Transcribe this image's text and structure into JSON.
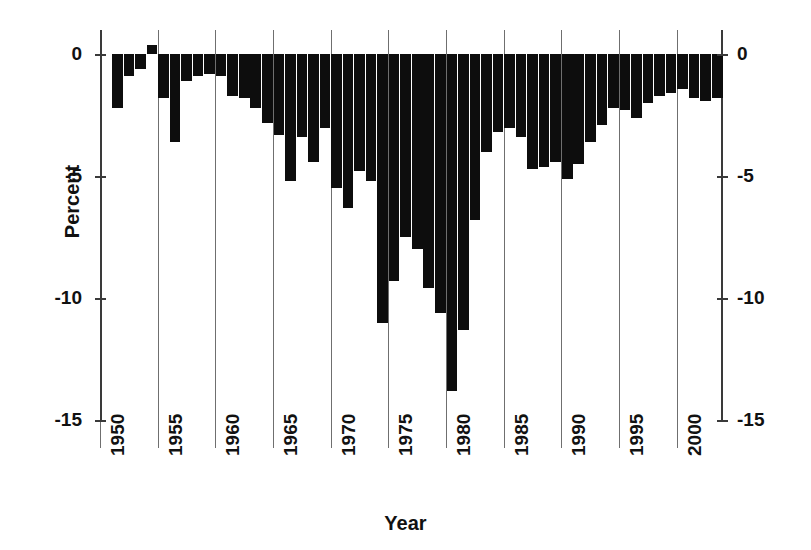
{
  "chart_data": {
    "type": "bar",
    "title": "",
    "xlabel": "Year",
    "ylabel": "Percent",
    "ylim": [
      -15,
      1
    ],
    "xlim": [
      1950,
      2004
    ],
    "grid": true,
    "legend_position": "none",
    "y_ticks": [
      "0",
      "-5",
      "-10",
      "-15"
    ],
    "y_tick_values": [
      0,
      -5,
      -10,
      -15
    ],
    "x_ticks": [
      "1950",
      "1955",
      "1960",
      "1965",
      "1970",
      "1975",
      "1980",
      "1985",
      "1990",
      "1995",
      "2000"
    ],
    "x_tick_values": [
      1950,
      1955,
      1960,
      1965,
      1970,
      1975,
      1980,
      1985,
      1990,
      1995,
      2000
    ],
    "bar_color": "#0d0d0d",
    "categories": [
      1951,
      1952,
      1953,
      1954,
      1955,
      1956,
      1957,
      1958,
      1959,
      1960,
      1961,
      1962,
      1963,
      1964,
      1965,
      1966,
      1967,
      1968,
      1969,
      1970,
      1971,
      1972,
      1973,
      1974,
      1975,
      1976,
      1977,
      1978,
      1979,
      1980,
      1981,
      1982,
      1983,
      1984,
      1985,
      1986,
      1987,
      1988,
      1989,
      1990,
      1991,
      1992,
      1993,
      1994,
      1995,
      1996,
      1997,
      1998,
      1999,
      2000,
      2001,
      2002,
      2003
    ],
    "values": [
      -2.2,
      -0.9,
      -0.6,
      0.4,
      -1.8,
      -3.6,
      -1.1,
      -0.9,
      -0.8,
      -0.9,
      -1.7,
      -1.8,
      -2.2,
      -2.8,
      -3.3,
      -5.2,
      -3.4,
      -4.4,
      -3.0,
      -5.5,
      -6.3,
      -4.8,
      -5.2,
      -11.0,
      -9.3,
      -7.5,
      -8.0,
      -9.6,
      -10.6,
      -13.8,
      -11.3,
      -6.8,
      -4.0,
      -3.2,
      -3.0,
      -3.4,
      -4.7,
      -4.6,
      -4.4,
      -5.1,
      -4.5,
      -3.6,
      -2.9,
      -2.2,
      -2.3,
      -2.6,
      -2.0,
      -1.7,
      -1.6,
      -1.4,
      -1.8,
      -1.9,
      -1.8
    ]
  },
  "axes": {
    "x_title": "Year",
    "y_title": "Percent"
  }
}
